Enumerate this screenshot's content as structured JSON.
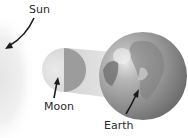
{
  "diagram": {
    "type": "solar-eclipse-alignment",
    "labels": {
      "sun": "Sun",
      "moon": "Moon",
      "earth": "Earth"
    },
    "bodies": [
      {
        "name": "Sun",
        "position": "left edge, off-frame glow"
      },
      {
        "name": "Moon",
        "position": "center",
        "shading": "half lit (left), half dark (right)"
      },
      {
        "name": "Earth",
        "position": "right",
        "shading": "grey globe"
      }
    ],
    "shadow": "Moon's shadow cone projected toward Earth",
    "colors": {
      "background": "#ffffff",
      "sun_glow": "#ececec",
      "moon_lit": "#dedede",
      "moon_dark": "#9a9a9a",
      "shadow_cone": "#d4d4d4",
      "earth_light": "#c4c4c4",
      "earth_dark": "#6e6e6e",
      "arrow": "#1a1a1a",
      "text": "#2a2a2a"
    }
  }
}
